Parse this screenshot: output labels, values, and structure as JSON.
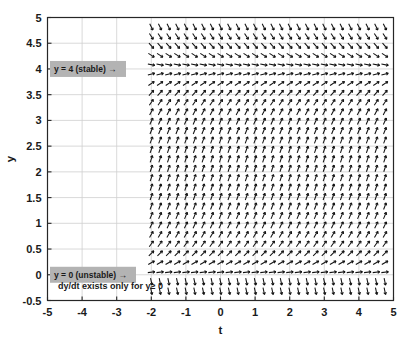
{
  "figure": {
    "background_color": "#ffffff",
    "plot_background_color": "#ffffff",
    "axis_color": "#262626",
    "grid_color": "#cfcfcf",
    "arrow_color": "#111111",
    "annotation_box_color": "#b3b3b3"
  },
  "axes": {
    "x": {
      "label": "t",
      "ticks": [
        "-5",
        "-4",
        "-3",
        "-2",
        "-1",
        "0",
        "1",
        "2",
        "3",
        "4",
        "5"
      ],
      "tick_values": [
        -5,
        -4,
        -3,
        -2,
        -1,
        0,
        1,
        2,
        3,
        4,
        5
      ],
      "min": -5,
      "max": 5
    },
    "y": {
      "label": "y",
      "ticks": [
        "5",
        "4.5",
        "4",
        "3.5",
        "3",
        "2.5",
        "2",
        "1.5",
        "1",
        "0.5",
        "0",
        "-0.5"
      ],
      "tick_values": [
        5,
        4.5,
        4,
        3.5,
        3,
        2.5,
        2,
        1.5,
        1,
        0.5,
        0,
        -0.5
      ],
      "min": -0.5,
      "max": 5
    }
  },
  "annotations": {
    "stable_label": "y = 4 (stable)  →",
    "unstable_label": "y = 0 (unstable)  →",
    "domain_note": "dy/dt exists only for y≥ 0"
  },
  "chart_data": {
    "type": "quiver",
    "title": "",
    "xlabel": "t",
    "ylabel": "y",
    "xlim": [
      -5,
      5
    ],
    "ylim": [
      -0.5,
      5
    ],
    "grid": true,
    "legend": "none",
    "field_domain": {
      "t_start": -2,
      "t_end": 5,
      "y_start": -0.5,
      "y_end": 5
    },
    "grid_spacing": {
      "t": 0.25,
      "y": 0.1786
    },
    "equilibria": [
      {
        "y": 4,
        "type": "stable",
        "label": "y = 4 (stable)"
      },
      {
        "y": 0,
        "type": "unstable",
        "label": "y = 0 (unstable)"
      }
    ],
    "slope_samples": [
      {
        "y": 5.0,
        "slope": -1.6
      },
      {
        "y": 4.75,
        "slope": -1.2
      },
      {
        "y": 4.5,
        "slope": -0.85
      },
      {
        "y": 4.25,
        "slope": -0.45
      },
      {
        "y": 4.0,
        "slope": 0.0
      },
      {
        "y": 3.75,
        "slope": 0.45
      },
      {
        "y": 3.5,
        "slope": 0.85
      },
      {
        "y": 3.0,
        "slope": 1.5
      },
      {
        "y": 2.5,
        "slope": 1.9
      },
      {
        "y": 2.0,
        "slope": 2.0
      },
      {
        "y": 1.5,
        "slope": 1.85
      },
      {
        "y": 1.0,
        "slope": 1.5
      },
      {
        "y": 0.5,
        "slope": 1.0
      },
      {
        "y": 0.25,
        "slope": 0.6
      },
      {
        "y": 0.0,
        "slope": 0.0
      },
      {
        "y": -0.25,
        "slope": -3.0
      },
      {
        "y": -0.5,
        "slope": -3.2
      }
    ]
  }
}
